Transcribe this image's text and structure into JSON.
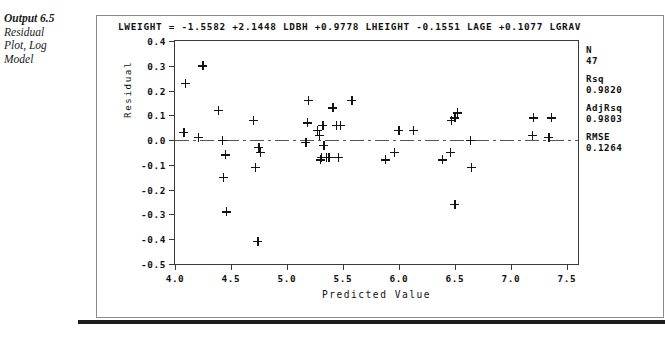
{
  "caption": {
    "title": "Output 6.5",
    "lines": [
      "Residual",
      "Plot, Log",
      "Model"
    ]
  },
  "equation": "LWEIGHT  =  -1.5582  +2.1448 LDBH  +0.9778 LHEIGHT  -0.1551 LAGE  +0.1077 LGRAV",
  "stats": [
    {
      "name": "N",
      "value": "47"
    },
    {
      "name": "Rsq",
      "value": "0.9820"
    },
    {
      "name": "AdjRsq",
      "value": "0.9803"
    },
    {
      "name": "RMSE",
      "value": "0.1264"
    }
  ],
  "chart_data": {
    "type": "scatter",
    "title": "LWEIGHT  =  -1.5582  +2.1448 LDBH  +0.9778 LHEIGHT  -0.1551 LAGE  +0.1077 LGRAV",
    "xlabel": "Predicted Value",
    "ylabel": "Residual",
    "xlim": [
      4.0,
      7.6
    ],
    "ylim": [
      -0.5,
      0.4
    ],
    "xticks": [
      "4.0",
      "4.5",
      "5.0",
      "5.5",
      "6.0",
      "6.5",
      "7.0",
      "7.5"
    ],
    "xtick_values": [
      4.0,
      4.5,
      5.0,
      5.5,
      6.0,
      6.5,
      7.0,
      7.5
    ],
    "yticks": [
      "0.4",
      "0.3",
      "0.2",
      "0.1",
      "0.0",
      "-0.1",
      "-0.2",
      "-0.3",
      "-0.4",
      "-0.5"
    ],
    "ytick_values": [
      0.4,
      0.3,
      0.2,
      0.1,
      0.0,
      -0.1,
      -0.2,
      -0.3,
      -0.4,
      -0.5
    ],
    "grid": false,
    "legend": null,
    "reference_line": {
      "y": 0.0,
      "style": "dash-dot"
    },
    "marker": "plus",
    "n_points": 47,
    "points": [
      {
        "x": 4.09,
        "y": 0.23
      },
      {
        "x": 4.08,
        "y": 0.03
      },
      {
        "x": 4.25,
        "y": 0.3
      },
      {
        "x": 4.21,
        "y": 0.01
      },
      {
        "x": 4.39,
        "y": 0.12
      },
      {
        "x": 4.42,
        "y": 0.0
      },
      {
        "x": 4.45,
        "y": -0.06
      },
      {
        "x": 4.43,
        "y": -0.15
      },
      {
        "x": 4.46,
        "y": -0.29
      },
      {
        "x": 4.7,
        "y": 0.08
      },
      {
        "x": 4.75,
        "y": -0.03
      },
      {
        "x": 4.76,
        "y": -0.05
      },
      {
        "x": 4.72,
        "y": -0.11
      },
      {
        "x": 4.74,
        "y": -0.41
      },
      {
        "x": 5.19,
        "y": 0.16
      },
      {
        "x": 5.18,
        "y": 0.07
      },
      {
        "x": 5.17,
        "y": -0.01
      },
      {
        "x": 5.27,
        "y": 0.04
      },
      {
        "x": 5.29,
        "y": 0.02
      },
      {
        "x": 5.32,
        "y": 0.06
      },
      {
        "x": 5.33,
        "y": -0.02
      },
      {
        "x": 5.31,
        "y": -0.07
      },
      {
        "x": 5.3,
        "y": -0.08
      },
      {
        "x": 5.35,
        "y": -0.07
      },
      {
        "x": 5.37,
        "y": -0.07
      },
      {
        "x": 5.38,
        "y": -0.07
      },
      {
        "x": 5.41,
        "y": 0.13
      },
      {
        "x": 5.44,
        "y": 0.06
      },
      {
        "x": 5.48,
        "y": 0.06
      },
      {
        "x": 5.46,
        "y": -0.07
      },
      {
        "x": 5.58,
        "y": 0.16
      },
      {
        "x": 5.88,
        "y": -0.08
      },
      {
        "x": 5.96,
        "y": -0.05
      },
      {
        "x": 6.0,
        "y": 0.04
      },
      {
        "x": 6.13,
        "y": 0.04
      },
      {
        "x": 6.39,
        "y": -0.08
      },
      {
        "x": 6.46,
        "y": -0.05
      },
      {
        "x": 6.47,
        "y": 0.08
      },
      {
        "x": 6.5,
        "y": 0.09
      },
      {
        "x": 6.52,
        "y": 0.11
      },
      {
        "x": 6.5,
        "y": -0.26
      },
      {
        "x": 6.64,
        "y": 0.0
      },
      {
        "x": 6.65,
        "y": -0.11
      },
      {
        "x": 7.2,
        "y": 0.09
      },
      {
        "x": 7.19,
        "y": 0.02
      },
      {
        "x": 7.36,
        "y": 0.09
      },
      {
        "x": 7.34,
        "y": 0.01
      }
    ]
  }
}
